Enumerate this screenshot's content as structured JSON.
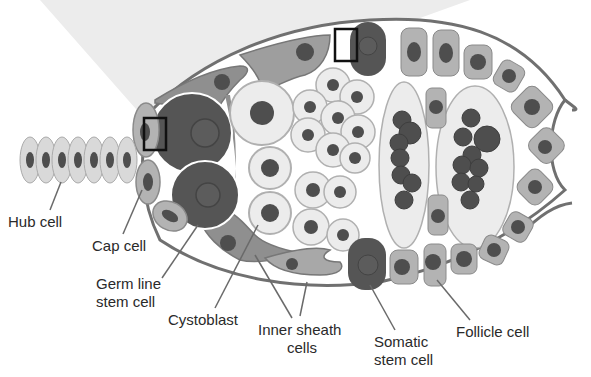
{
  "colors": {
    "background": "#ffffff",
    "zoom_cone": "#ececec",
    "outline": "#707070",
    "light_cell": "#e6e6e6",
    "mid_cell": "#a8a8a8",
    "dark_cell": "#555555",
    "nucleus": "#4e4e4e",
    "leader_line": "#6a6a6a",
    "label_text": "#2a2a2a"
  },
  "labels": {
    "hub_cell": "Hub cell",
    "cap_cell": "Cap cell",
    "germ_line_stem_cell_1": "Germ line",
    "germ_line_stem_cell_2": "stem cell",
    "cystoblast": "Cystoblast",
    "inner_sheath_cells_1": "Inner sheath",
    "inner_sheath_cells_2": "cells",
    "somatic_stem_cell_1": "Somatic",
    "somatic_stem_cell_2": "stem cell",
    "follicle_cell": "Follicle cell"
  },
  "structures": {
    "hub_cell_count": 7,
    "highlight_boxes": 2,
    "egg_chambers": 2
  }
}
